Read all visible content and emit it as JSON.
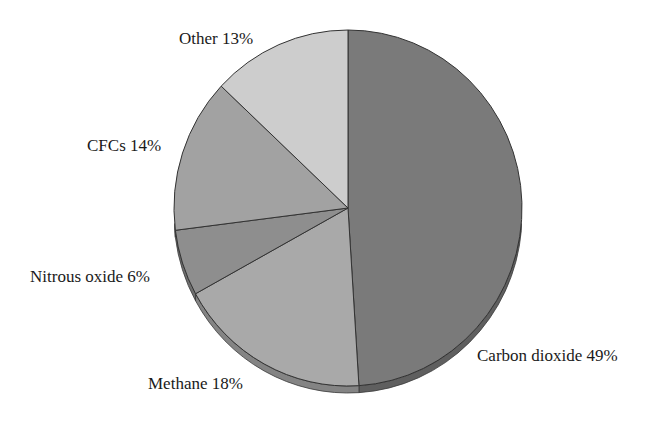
{
  "chart_data": {
    "type": "pie",
    "title": "",
    "style": "3d-tilted grayscale pie",
    "start_angle_deg": 0,
    "direction": "clockwise",
    "categories": [
      "Carbon dioxide",
      "Methane",
      "Nitrous oxide",
      "CFCs",
      "Other"
    ],
    "values": [
      49,
      18,
      6,
      14,
      13
    ],
    "unit": "%",
    "labels": [
      "Carbon dioxide 49%",
      "Methane 18%",
      "Nitrous oxide 6%",
      "CFCs 14%",
      "Other 13%"
    ],
    "colors": [
      "#7a7a7a",
      "#a9a9a9",
      "#8e8e8e",
      "#a2a2a2",
      "#cdcdcd"
    ],
    "legend": "none (direct labels)",
    "grid": false
  },
  "labels": {
    "co2": "Carbon dioxide 49%",
    "methane": "Methane 18%",
    "n2o": "Nitrous oxide 6%",
    "cfcs": "CFCs 14%",
    "other": "Other 13%"
  }
}
